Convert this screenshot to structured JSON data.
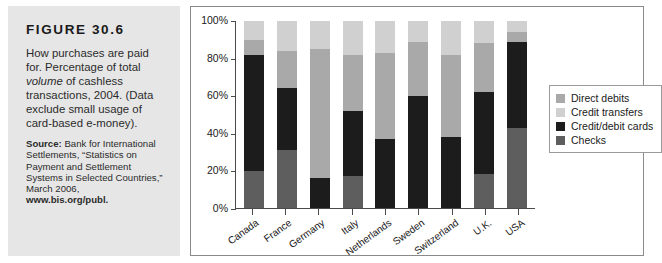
{
  "figure": {
    "label": "FIGURE 30.6",
    "caption_line1": "How purchases are paid for. Percentage of total ",
    "caption_italic": "volume",
    "caption_line2": " of cashless transactions, 2004. (Data exclude small usage of card-based e-money).",
    "source_label": "Source:",
    "source_text": " Bank for International Settlements, “Statistics on Payment and Settlement Systems in Selected Countries,” March 2006, ",
    "source_url": "www.bis.org/publ."
  },
  "colors": {
    "panel_background": "#e6e6e6",
    "chart_background": "#ffffff",
    "axis": "#4a4a4a",
    "direct_debits": "#a9a9a9",
    "credit_transfers": "#d0d0d0",
    "credit_debit_cards": "#1c1c1c",
    "checks": "#5e5e5e"
  },
  "chart_data": {
    "type": "bar",
    "title": "",
    "subtype": "stacked-vertical",
    "xlabel": "",
    "ylabel": "",
    "ylim": [
      0,
      100
    ],
    "ytick_labels": [
      "100%",
      "80%",
      "60%",
      "40%",
      "20%",
      "0%"
    ],
    "ytick_values": [
      100,
      80,
      60,
      40,
      20,
      0
    ],
    "grid": false,
    "legend_position": "right",
    "categories": [
      "Canada",
      "France",
      "Germany",
      "Italy",
      "Netherlands",
      "Sweden",
      "Switzerland",
      "U.K.",
      "USA"
    ],
    "stack_order_bottom_to_top": [
      "Checks",
      "Credit/debit cards",
      "Direct debits",
      "Credit transfers"
    ],
    "series": [
      {
        "name": "Checks",
        "color": "#5e5e5e",
        "values": [
          20,
          31,
          0,
          17,
          0,
          0,
          0,
          18,
          43
        ]
      },
      {
        "name": "Credit/debit cards",
        "color": "#1c1c1c",
        "values": [
          62,
          33,
          16,
          35,
          37,
          60,
          38,
          44,
          46
        ]
      },
      {
        "name": "Direct debits",
        "color": "#a9a9a9",
        "values": [
          8,
          20,
          69,
          30,
          46,
          29,
          44,
          26,
          5
        ]
      },
      {
        "name": "Credit transfers",
        "color": "#d0d0d0",
        "values": [
          10,
          16,
          15,
          18,
          17,
          11,
          18,
          12,
          6
        ]
      }
    ],
    "legend_entries": [
      {
        "label": "Direct debits",
        "color": "#a9a9a9"
      },
      {
        "label": "Credit transfers",
        "color": "#d0d0d0"
      },
      {
        "label": "Credit/debit cards",
        "color": "#1c1c1c"
      },
      {
        "label": "Checks",
        "color": "#5e5e5e"
      }
    ]
  }
}
